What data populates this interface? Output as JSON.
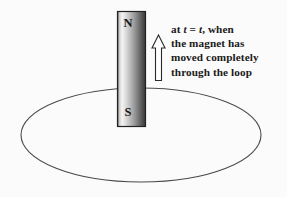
{
  "figure": {
    "background_color": "#fbfbfb",
    "ink_color": "#1a1a1a"
  },
  "caption": {
    "lines": [
      "at t = t, when",
      "the magnet has",
      "moved completely",
      "through the loop"
    ],
    "line1_prefix": "at ",
    "line1_var1": "t",
    "line1_equals": " = ",
    "line1_var2": "t",
    "line1_suffix": ", when",
    "line2": "the magnet has",
    "line3": "moved completely",
    "line4": "through the loop"
  },
  "magnet": {
    "north_label": "N",
    "south_label": "S",
    "border_color": "#222222",
    "gradient_light": "#ffffff",
    "gradient_dark": "#3a3a3a",
    "x": 117,
    "y": 11,
    "width": 29,
    "height": 116
  },
  "loop": {
    "shape": "ellipse",
    "center_x": 141,
    "center_y": 135,
    "radius_x": 120,
    "radius_y": 47,
    "stroke_color": "#4a4a4a",
    "stroke_width": 1
  },
  "arrow": {
    "direction": "up",
    "label": "motion direction",
    "fill": "#ffffff",
    "stroke": "#2a2a2a",
    "x": 152,
    "y": 35,
    "width": 13,
    "height": 46
  }
}
